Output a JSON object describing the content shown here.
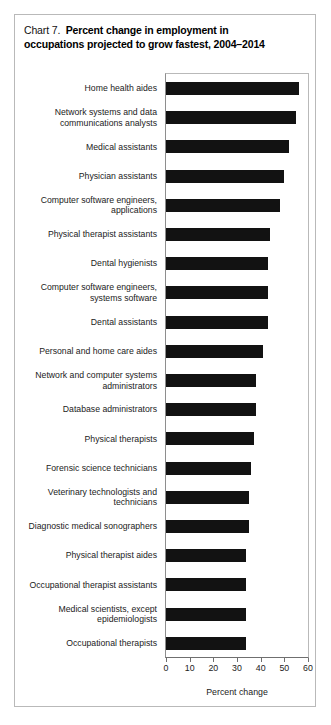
{
  "figure": {
    "chart_number_label": "Chart 7.",
    "title_line_1": "Percent change in employment in",
    "title_line_2": "occupations projected to grow fastest, 2004–2014",
    "bar_color": "#121212",
    "frame_color": "#b9b9b9"
  },
  "chart_data": {
    "type": "bar",
    "orientation": "horizontal",
    "xlabel": "Percent change",
    "ylabel": "",
    "xlim": [
      0,
      60
    ],
    "xticks": [
      0,
      10,
      20,
      30,
      40,
      50,
      60
    ],
    "xtick_labels": [
      "0",
      "10",
      "20",
      "30",
      "40",
      "50",
      "60"
    ],
    "grid": false,
    "legend": "none",
    "categories": [
      "Home health aides",
      "Network systems and data communications analysts",
      "Medical assistants",
      "Physician assistants",
      "Computer software engineers, applications",
      "Physical therapist assistants",
      "Dental hygienists",
      "Computer software engineers, systems software",
      "Dental assistants",
      "Personal and home care aides",
      "Network and computer systems administrators",
      "Database administrators",
      "Physical therapists",
      "Forensic science technicians",
      "Veterinary technologists and technicians",
      "Diagnostic medical sonographers",
      "Physical therapist aides",
      "Occupational therapist assistants",
      "Medical scientists, except epidemiologists",
      "Occupational therapists"
    ],
    "values": [
      56,
      55,
      52,
      50,
      48,
      44,
      43,
      43,
      43,
      41,
      38,
      38,
      37,
      36,
      35,
      35,
      34,
      34,
      34,
      34
    ],
    "category_lines": [
      [
        "Home health aides"
      ],
      [
        "Network systems and data",
        "communications analysts"
      ],
      [
        "Medical assistants"
      ],
      [
        "Physician assistants"
      ],
      [
        "Computer software engineers,",
        "applications"
      ],
      [
        "Physical therapist assistants"
      ],
      [
        "Dental hygienists"
      ],
      [
        "Computer software engineers,",
        "systems software"
      ],
      [
        "Dental assistants"
      ],
      [
        "Personal and home care aides"
      ],
      [
        "Network and computer systems",
        "administrators"
      ],
      [
        "Database administrators"
      ],
      [
        "Physical therapists"
      ],
      [
        "Forensic science technicians"
      ],
      [
        "Veterinary technologists and",
        "technicians"
      ],
      [
        "Diagnostic medical sonographers"
      ],
      [
        "Physical therapist aides"
      ],
      [
        "Occupational therapist assistants"
      ],
      [
        "Medical scientists, except",
        "epidemiologists"
      ],
      [
        "Occupational therapists"
      ]
    ]
  }
}
